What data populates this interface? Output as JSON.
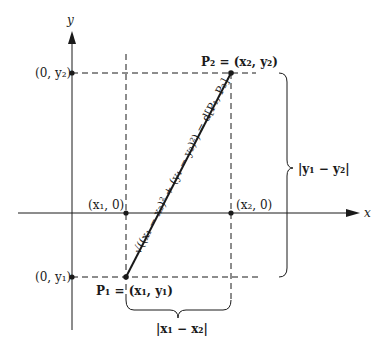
{
  "axes": {
    "x_label": "x",
    "y_label": "y"
  },
  "points": {
    "p1": {
      "name": "P",
      "sub": "1",
      "coord": "(x₁, y₁)",
      "label": "P₁ = (x₁, y₁)"
    },
    "p2": {
      "name": "P",
      "sub": "2",
      "coord": "(x₂, y₂)",
      "label": "P₂ = (x₂, y₂)"
    },
    "x1_axis": "(x₁, 0)",
    "x2_axis": "(x₂, 0)",
    "y1_axis": "(0, y₁)",
    "y2_axis": "(0, y₂)"
  },
  "distance_formula": "√((x₁ − x₂)² + (y₁ − y₂)²) = d[P₁, P₂]",
  "braces": {
    "horizontal": "|x₁ − x₂|",
    "vertical": "|y₁ − y₂|"
  },
  "colors": {
    "ink": "#1a1a1a",
    "background": "#ffffff"
  }
}
